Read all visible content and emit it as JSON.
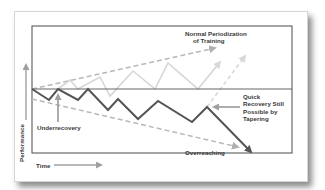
{
  "diagram": {
    "labels": {
      "normal": "Normal Periodization",
      "normal_line2": "of Training",
      "quick1": "Quick",
      "quick2": "Recovery Still",
      "quick3": "Possible by",
      "quick4": "Tapering",
      "underrecovery": "Underrecovery",
      "overreaching": "Overreaching",
      "performance_axis": "Performance",
      "time_axis": "Time"
    },
    "colors": {
      "dark_line": "#555555",
      "light_line": "#d4d4d4",
      "dashed_line": "#b8b8b8",
      "frame": "#4a4a4a",
      "arrow": "#999999"
    }
  }
}
